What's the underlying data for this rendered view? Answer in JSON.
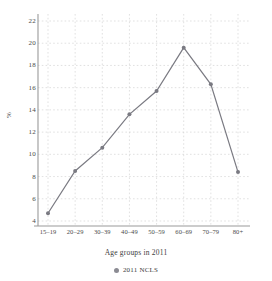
{
  "chart_data": {
    "type": "line",
    "title": "",
    "subtitle": "",
    "xlabel": "Age groups in 2011",
    "ylabel": "%",
    "categories": [
      "15–19",
      "20–29",
      "30–39",
      "40–49",
      "50–59",
      "60–69",
      "70–79",
      "80+"
    ],
    "series": [
      {
        "name": "2011 NCLS",
        "values": [
          4.7,
          8.5,
          10.6,
          13.6,
          15.7,
          19.6,
          16.3,
          8.4
        ],
        "color": "#7a7a82",
        "marker": "circle"
      }
    ],
    "ylim": [
      4,
      22
    ],
    "yticks": [
      4,
      6,
      8,
      10,
      12,
      14,
      16,
      18,
      20,
      22
    ],
    "ytick_labels": [
      "4",
      "6",
      "8",
      "10",
      "12",
      "14",
      "16",
      "18",
      "20",
      "22"
    ],
    "grid": true,
    "grid_style": "dashed",
    "grid_color": "#cccccc",
    "legend_position": "bottom-center",
    "legend_entries": [
      "2011 NCLS"
    ],
    "axis_color": "#9a9a9a",
    "background": "#ffffff"
  }
}
